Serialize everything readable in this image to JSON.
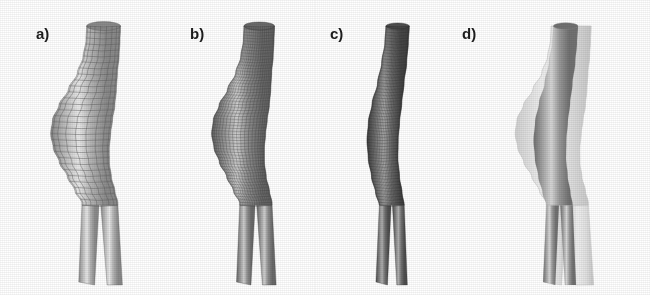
{
  "figure": {
    "background_color": "#ffffff",
    "width": 650,
    "height": 295
  },
  "panels": [
    {
      "id": "a",
      "label": "a)",
      "label_x": 36,
      "label_y": 26,
      "origin_x": 0,
      "width": 170,
      "description": "coarse quad surface mesh, light gray shading, visible grid lines",
      "mesh": "coarse-quad",
      "mesh_visible": true,
      "cell_px": 9,
      "fill_light": "#e8e8e8",
      "fill_mid": "#b4b4b4",
      "fill_dark": "#8a8a8a",
      "line_color": "#5c5c5c",
      "line_opacity": 0.55,
      "overlay": false,
      "profile": "aneurysm",
      "shape_scale": 1.0
    },
    {
      "id": "b",
      "label": "b)",
      "label_x": 190,
      "label_y": 26,
      "origin_x": 170,
      "width": 145,
      "description": "fine quad surface mesh, darker gray shading, dense grid",
      "mesh": "fine-quad",
      "mesh_visible": true,
      "cell_px": 4,
      "fill_light": "#cfcfcf",
      "fill_mid": "#909090",
      "fill_dark": "#6a6a6a",
      "line_color": "#3d3d3d",
      "line_opacity": 0.5,
      "overlay": false,
      "profile": "aneurysm",
      "shape_scale": 0.9
    },
    {
      "id": "c",
      "label": "c)",
      "label_x": 330,
      "label_y": 26,
      "origin_x": 315,
      "width": 140,
      "description": "narrow repaired geometry, very fine dark mesh, aneurysm bulge removed",
      "mesh": "fine-quad",
      "mesh_visible": true,
      "cell_px": 3,
      "fill_light": "#b0b0b0",
      "fill_mid": "#747474",
      "fill_dark": "#4e4e4e",
      "line_color": "#2a2a2a",
      "line_opacity": 0.45,
      "overlay": false,
      "profile": "repaired",
      "shape_scale": 0.78
    },
    {
      "id": "d",
      "label": "d)",
      "label_x": 462,
      "label_y": 26,
      "origin_x": 455,
      "width": 195,
      "description": "overlay of translucent original aneurysm surface with darker repaired geometry inside",
      "mesh": "smooth",
      "mesh_visible": false,
      "cell_px": 0,
      "fill_light": "#d7d7d7",
      "fill_mid": "#9a9a9a",
      "fill_dark": "#717171",
      "line_color": "#8a8a8a",
      "line_opacity": 0.2,
      "overlay": true,
      "overlay_outer_color": "#d9d9d9",
      "overlay_outer_opacity": 0.85,
      "profile": "overlay",
      "shape_scale": 1.0
    }
  ],
  "colors": {
    "background": "#ffffff",
    "label_text": "#1c1c1c",
    "mesh_line": "#4a4a4a",
    "surface_light": "#e6e6e6",
    "surface_dark": "#6f6f6f"
  }
}
